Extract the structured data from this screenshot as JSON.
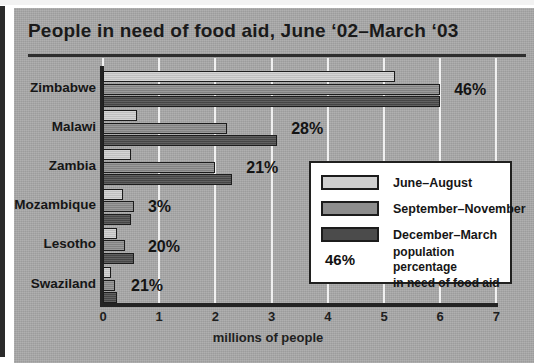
{
  "figure": {
    "title": "People in need of food aid, June ‘02–March ‘03"
  },
  "legend": {
    "items": [
      {
        "label": "June–August",
        "color": "#cfcfcf",
        "swatch_name": "legend-swatch-june-august"
      },
      {
        "label": "September–November",
        "color": "#8d8d8d",
        "swatch_name": "legend-swatch-september-november"
      },
      {
        "label": "December–March",
        "color": "#4b4b4b",
        "swatch_name": "legend-swatch-december-march"
      }
    ],
    "note_value": "46%",
    "note_line1": "population percentage",
    "note_line2": "in need of food aid"
  },
  "chart_data": {
    "type": "bar",
    "orientation": "horizontal",
    "title": "People in need of food aid, June ‘02–March ‘03",
    "xlabel": "millions of people",
    "ylabel": "",
    "xlim": [
      0,
      7
    ],
    "xticks": [
      "0",
      "1",
      "2",
      "3",
      "4",
      "5",
      "6",
      "7"
    ],
    "grid": "vertical-white-gridlines",
    "legend_position": "inside-right",
    "categories": [
      "Zimbabwe",
      "Malawi",
      "Zambia",
      "Mozambique",
      "Lesotho",
      "Swaziland"
    ],
    "series": [
      {
        "name": "June–August",
        "color": "#cfcfcf",
        "values": [
          5.2,
          0.6,
          0.5,
          0.35,
          0.25,
          0.15
        ]
      },
      {
        "name": "September–November",
        "color": "#8d8d8d",
        "values": [
          6.0,
          2.2,
          2.0,
          0.55,
          0.4,
          0.22
        ]
      },
      {
        "name": "December–March",
        "color": "#4b4b4b",
        "values": [
          6.0,
          3.1,
          2.3,
          0.5,
          0.55,
          0.25
        ]
      }
    ],
    "data_labels": {
      "name": "population percentage in need of food aid",
      "values": [
        "46%",
        "28%",
        "21%",
        "3%",
        "20%",
        "21%"
      ]
    }
  }
}
